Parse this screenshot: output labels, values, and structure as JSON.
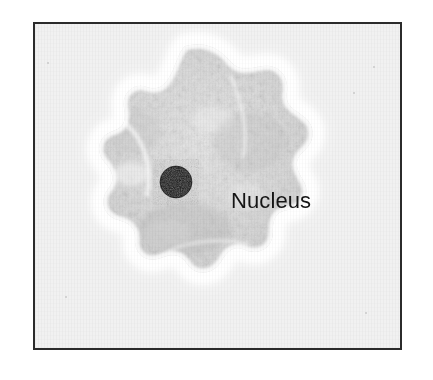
{
  "figure": {
    "kind": "micrograph-diagram",
    "border_color": "#2b2b2b",
    "plate_background": "#f1f1f1",
    "page_background": "#ffffff"
  },
  "labels": [
    {
      "id": "nucleus",
      "text": "Nucleus",
      "color": "#151515",
      "x": 196,
      "y": 164
    }
  ],
  "structures": {
    "cell": {
      "name": "cell-body",
      "description": "lobed amoeboid cell outline with bright white halo and grainy gray cytoplasm",
      "cytoplasm_color": "#d7d7d7",
      "halo_color": "#ffffff",
      "bounds": {
        "x": 40,
        "y": 46,
        "width": 245,
        "height": 240
      }
    },
    "nucleus": {
      "name": "nucleus",
      "description": "dark mottled round organelle",
      "color": "#1a1a1a",
      "center_x": 141,
      "center_y": 158,
      "radius": 16
    }
  },
  "specks": [
    {
      "x": 12,
      "y": 38,
      "size": 2
    },
    {
      "x": 338,
      "y": 42,
      "size": 2
    },
    {
      "x": 318,
      "y": 68,
      "size": 2
    },
    {
      "x": 30,
      "y": 272,
      "size": 2
    },
    {
      "x": 330,
      "y": 288,
      "size": 2
    }
  ]
}
